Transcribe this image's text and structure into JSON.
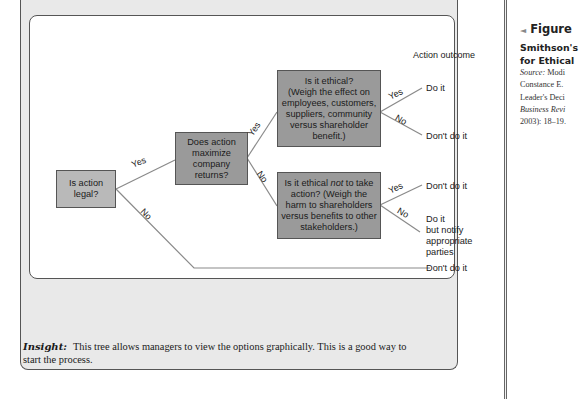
{
  "figure": {
    "marker": "◄",
    "label": "Figure",
    "subtitle_line1": "Smithson's",
    "subtitle_line2": "for Ethical",
    "source_label": "Source:",
    "source_lines": [
      "Modi",
      "Constance E. ",
      "Leader's Deci",
      "Business Revi",
      "2003): 18–19."
    ]
  },
  "diagram": {
    "column_header": "Action outcome",
    "nodes": {
      "legal": "Is action legal?",
      "maximize": "Does action maximize company returns?",
      "ethical_line1": "Is it ethical?",
      "ethical_line2": "(Weigh the effect on employees, customers, suppliers, community versus shareholder benefit.)",
      "not_ethical_pre": "Is it ethical ",
      "not_ethical_em": "not",
      "not_ethical_post": " to take action? (Weigh the harm to shareholders versus benefits to other stakeholders.)"
    },
    "branches": {
      "legal_yes": "Yes",
      "legal_no": "No",
      "maximize_yes": "Yes",
      "maximize_no": "No",
      "ethical_yes": "Yes",
      "ethical_no": "No",
      "not_ethical_yes": "Yes",
      "not_ethical_no": "No"
    },
    "outcomes": {
      "ethical_yes": "Do it",
      "ethical_no": "Don't do it",
      "not_ethical_yes": "Don't do it",
      "not_ethical_no_line1": "Do it",
      "not_ethical_no_line2": "but notify",
      "not_ethical_no_line3": "appropriate",
      "not_ethical_no_line4": "parties",
      "legal_no": "Don't do it"
    },
    "colors": {
      "node_dark": "#9a9a9a",
      "node_light": "#b9b9b9",
      "line": "#888888"
    }
  },
  "insight": {
    "label": "Insight:",
    "text": "This tree allows managers to view the options graphically. This is a good way to start the process."
  }
}
